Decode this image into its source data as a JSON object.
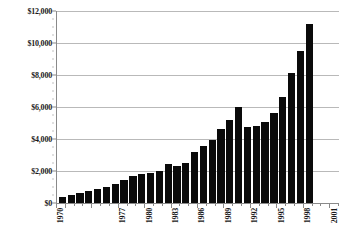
{
  "chart_data": {
    "type": "bar",
    "title": "",
    "xlabel": "",
    "ylabel": "",
    "ylim": [
      0,
      12000
    ],
    "y_tick_labels": [
      "$0",
      "$2,000",
      "$4,000",
      "$6,000",
      "$8,000",
      "$10,000",
      "$12,000"
    ],
    "y_tick_values": [
      0,
      2000,
      4000,
      6000,
      8000,
      10000,
      12000
    ],
    "grid": true,
    "legend": "none",
    "bar_color": "#0a0a0a",
    "gridline_color": "#b9b9b9",
    "axis_color": "#8a8a8a",
    "categories": [
      "1970",
      "1971",
      "1972",
      "1973",
      "1974",
      "1975",
      "1976",
      "1977",
      "1978",
      "1979",
      "1980",
      "1981",
      "1982",
      "1983",
      "1984",
      "1985",
      "1986",
      "1987",
      "1988",
      "1989",
      "1990",
      "1991",
      "1992",
      "1993",
      "1994",
      "1995",
      "1996",
      "1997",
      "1998",
      "1999",
      "2000",
      "2001"
    ],
    "values": [
      380,
      470,
      600,
      720,
      850,
      1020,
      1180,
      1450,
      1700,
      1820,
      1900,
      2020,
      2420,
      2330,
      2490,
      3200,
      3560,
      3940,
      4620,
      5170,
      6000,
      4750,
      4820,
      5040,
      5600,
      6650,
      8150,
      9530,
      11180,
      0,
      0,
      0
    ],
    "visible_x_tick_labels": [
      "1970",
      "1977",
      "1980",
      "1983",
      "1986",
      "1989",
      "1992",
      "1995",
      "1998",
      "2001"
    ],
    "visible_x_tick_indices": [
      0,
      7,
      10,
      13,
      16,
      19,
      22,
      25,
      28,
      31
    ]
  }
}
